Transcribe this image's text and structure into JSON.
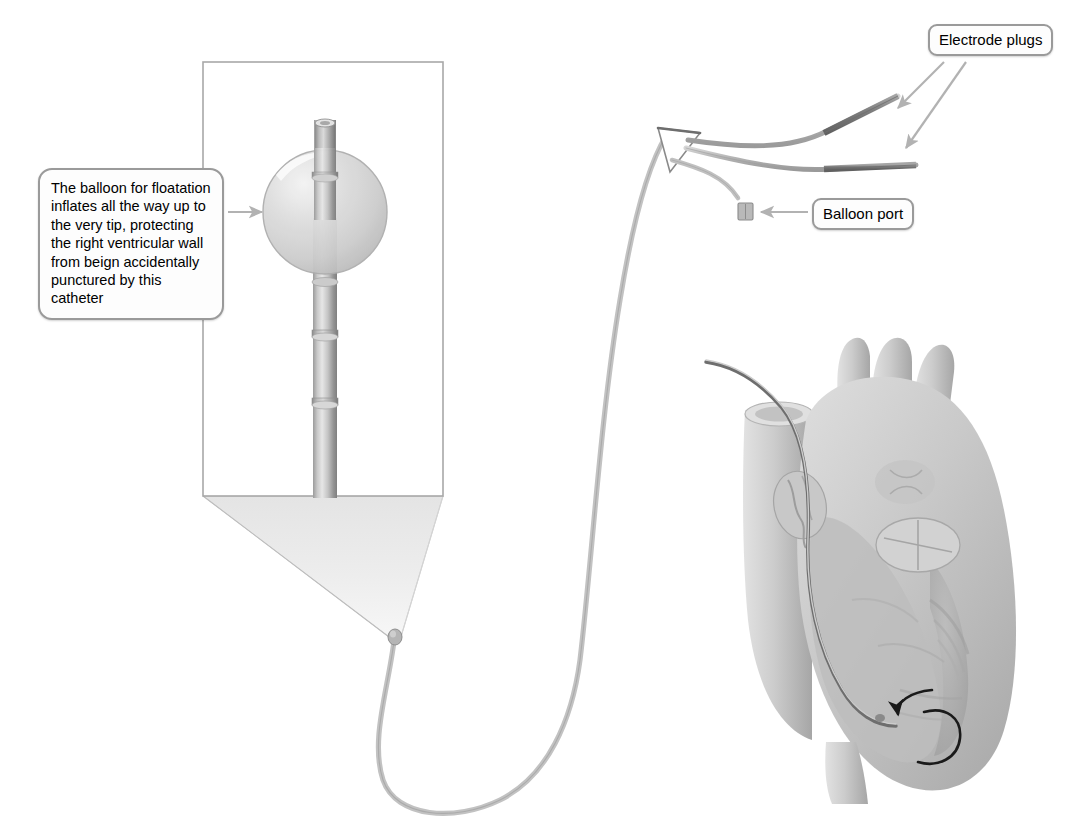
{
  "figure": {
    "title_alt": "Balloon-tipped pacing catheter in the right ventricle",
    "background_color": "#ffffff"
  },
  "callouts": [
    {
      "id": "balloon-description",
      "text": "The balloon for floatation inflates all the way up to the very tip, protecting the right ventricular wall from beign accidentally punctured by this catheter",
      "border_color": "#9a9a9a",
      "fill_color": "#fdfdfd",
      "text_color": "#000000"
    },
    {
      "id": "electrode-plugs",
      "text": "Electrode plugs",
      "border_color": "#9a9a9a",
      "fill_color": "#fdfdfd",
      "text_color": "#000000"
    },
    {
      "id": "balloon-port",
      "text": "Balloon port",
      "border_color": "#9a9a9a",
      "fill_color": "#fdfdfd",
      "text_color": "#000000"
    }
  ],
  "annotations": {
    "leader_arrow_color": "#b0b0b0",
    "magnifier_border_color": "#a8a8a8",
    "magnifier_cone_fill": "#e9e9e9",
    "catheter_color": "#b9b9b9",
    "catheter_shade_color": "#8f8f8f",
    "electrode_band_color": "#8a8a8a",
    "balloon_fill": "#d3d3d3",
    "heart_base_color": "#cfcfcf",
    "heart_shadow_color": "#9d9d9d",
    "rotation_arrow_color": "#1a1a1a"
  },
  "parts": {
    "magnified_view_label": "magnified catheter tip with inflated balloon",
    "heart_label": "cutaway view of human heart",
    "electrode_plug_count": 2
  }
}
